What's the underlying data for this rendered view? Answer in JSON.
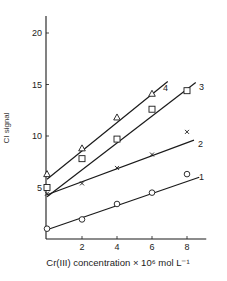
{
  "chart_data": {
    "type": "scatter",
    "title": "",
    "xlabel": "Cr(III) concentration × 10⁶ mol L⁻¹",
    "ylabel": "CI signal",
    "xlim": [
      0,
      9
    ],
    "ylim": [
      0,
      22
    ],
    "xticks": [
      2,
      4,
      6,
      8
    ],
    "yticks": [
      5,
      10,
      15,
      20
    ],
    "grid": false,
    "legend": "inline numeric labels at line ends",
    "series": [
      {
        "name": "1",
        "marker": "circle",
        "x": [
          0,
          2,
          4,
          6,
          8
        ],
        "y": [
          1.0,
          1.9,
          3.4,
          4.5,
          6.3
        ],
        "fit": [
          [
            0,
            0.9
          ],
          [
            8.7,
            6.0
          ]
        ]
      },
      {
        "name": "2",
        "marker": "x",
        "x": [
          0,
          2,
          4,
          6,
          8
        ],
        "y": [
          4.4,
          5.4,
          6.9,
          8.2,
          10.4
        ],
        "fit": [
          [
            0,
            4.3
          ],
          [
            8.4,
            9.6
          ]
        ]
      },
      {
        "name": "3",
        "marker": "square",
        "x": [
          0,
          2,
          4,
          6,
          8
        ],
        "y": [
          5.0,
          7.8,
          9.7,
          12.6,
          14.4
        ],
        "fit": [
          [
            0,
            4.1
          ],
          [
            8.5,
            15.2
          ]
        ]
      },
      {
        "name": "4",
        "marker": "triangle",
        "x": [
          0,
          2,
          4,
          6
        ],
        "y": [
          6.3,
          8.8,
          11.8,
          14.1
        ],
        "fit": [
          [
            0,
            5.8
          ],
          [
            6.9,
            15.3
          ]
        ]
      }
    ]
  },
  "labels": {
    "ylabel": "CI signal",
    "xlabel": "Cr(III) concentration × 10⁶ mol L⁻¹"
  }
}
